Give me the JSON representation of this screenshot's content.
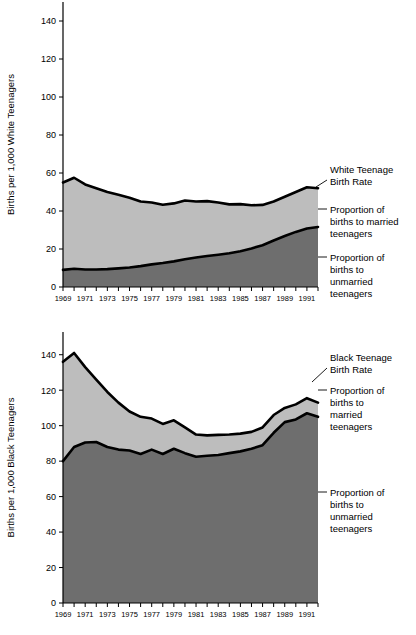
{
  "chart_data": [
    {
      "type": "area",
      "id": "white-teen-births",
      "title": "",
      "xlabel": "",
      "ylabel": "Births per 1,000 White Teenagers",
      "ylim": [
        0,
        150
      ],
      "yticks": [
        0,
        20,
        40,
        60,
        80,
        100,
        120,
        140
      ],
      "xlim": [
        1969,
        1992
      ],
      "x": [
        1969,
        1970,
        1971,
        1972,
        1973,
        1974,
        1975,
        1976,
        1977,
        1978,
        1979,
        1980,
        1981,
        1982,
        1983,
        1984,
        1985,
        1986,
        1987,
        1988,
        1989,
        1990,
        1991,
        1992
      ],
      "xticks": [
        1969,
        1970,
        1971,
        1972,
        1973,
        1974,
        1975,
        1976,
        1977,
        1978,
        1979,
        1980,
        1981,
        1982,
        1983,
        1984,
        1985,
        1986,
        1987,
        1988,
        1989,
        1990,
        1991,
        1992
      ],
      "xtick_labels": [
        "1969",
        "",
        "1971",
        "",
        "1973",
        "",
        "1975",
        "",
        "1977",
        "",
        "1979",
        "",
        "1981",
        "",
        "1983",
        "",
        "1985",
        "",
        "1987",
        "",
        "1989",
        "",
        "1991",
        ""
      ],
      "grid": false,
      "legend_position": "right-annotations",
      "series": [
        {
          "name": "White Teenage Birth Rate",
          "values": [
            55.0,
            57.5,
            54.0,
            52.0,
            50.0,
            48.5,
            47.0,
            45.0,
            44.5,
            43.3,
            44.0,
            45.5,
            45.0,
            45.2,
            44.5,
            43.5,
            43.6,
            43.0,
            43.2,
            45.0,
            47.5,
            50.0,
            52.5,
            52.0
          ]
        },
        {
          "name": "Proportion of births to unmarried teenagers",
          "values": [
            9.0,
            9.6,
            9.2,
            9.2,
            9.4,
            9.8,
            10.3,
            11.0,
            11.9,
            12.6,
            13.5,
            14.6,
            15.5,
            16.3,
            17.0,
            17.8,
            18.8,
            20.3,
            22.0,
            24.5,
            26.8,
            29.0,
            30.8,
            31.6
          ]
        }
      ],
      "bands": [
        {
          "name": "Proportion of births to married teenagers",
          "between": [
            "Proportion of births to unmarried teenagers",
            "White Teenage Birth Rate"
          ],
          "color": "#bdbdbd"
        },
        {
          "name": "Proportion of births to unmarried teenagers",
          "between": [
            "baseline",
            "Proportion of births to unmarried teenagers"
          ],
          "color": "#6e6e6e"
        }
      ],
      "annotations": [
        {
          "text": "White Teenage Birth Rate",
          "lines": [
            "White Teenage",
            "Birth Rate"
          ],
          "target_series": "White Teenage Birth Rate"
        },
        {
          "text": "Proportion of births to married teenagers",
          "lines": [
            "Proportion of",
            "births to married",
            "teenagers"
          ],
          "target_band": "Proportion of births to married teenagers"
        },
        {
          "text": "Proportion of births to unmarried teenagers",
          "lines": [
            "Proportion of",
            "births to",
            "unmarried",
            "teenagers"
          ],
          "target_band": "Proportion of births to unmarried teenagers"
        }
      ]
    },
    {
      "type": "area",
      "id": "black-teen-births",
      "title": "",
      "xlabel": "",
      "ylabel": "Births per 1,000 Black Teenagers",
      "ylim": [
        0,
        150
      ],
      "yticks": [
        0,
        20,
        40,
        60,
        80,
        100,
        120,
        140
      ],
      "xlim": [
        1969,
        1992
      ],
      "x": [
        1969,
        1970,
        1971,
        1972,
        1973,
        1974,
        1975,
        1976,
        1977,
        1978,
        1979,
        1980,
        1981,
        1982,
        1983,
        1984,
        1985,
        1986,
        1987,
        1988,
        1989,
        1990,
        1991,
        1992
      ],
      "xticks": [
        1969,
        1970,
        1971,
        1972,
        1973,
        1974,
        1975,
        1976,
        1977,
        1978,
        1979,
        1980,
        1981,
        1982,
        1983,
        1984,
        1985,
        1986,
        1987,
        1988,
        1989,
        1990,
        1991,
        1992
      ],
      "xtick_labels": [
        "1969",
        "",
        "1971",
        "",
        "1973",
        "",
        "1975",
        "",
        "1977",
        "",
        "1979",
        "",
        "1981",
        "",
        "1983",
        "",
        "1985",
        "",
        "1987",
        "",
        "1989",
        "",
        "1991",
        ""
      ],
      "grid": false,
      "legend_position": "right-annotations",
      "series": [
        {
          "name": "Black Teenage Birth Rate",
          "values": [
            136.0,
            141.0,
            133.0,
            126.0,
            119.0,
            113.0,
            108.0,
            105.0,
            104.0,
            101.0,
            103.0,
            99.0,
            95.0,
            94.5,
            94.8,
            95.0,
            95.5,
            96.5,
            99.0,
            106.0,
            110.0,
            112.0,
            115.5,
            113.0
          ]
        },
        {
          "name": "Proportion of births to unmarried teenagers",
          "values": [
            80.0,
            88.0,
            90.5,
            90.8,
            88.0,
            86.5,
            86.0,
            84.0,
            86.5,
            84.0,
            87.0,
            84.5,
            82.5,
            83.0,
            83.5,
            84.5,
            85.5,
            87.0,
            89.0,
            96.0,
            102.0,
            103.5,
            107.0,
            105.0
          ]
        }
      ],
      "bands": [
        {
          "name": "Proportion of births to married teenagers",
          "between": [
            "Proportion of births to unmarried teenagers",
            "Black Teenage Birth Rate"
          ],
          "color": "#bdbdbd"
        },
        {
          "name": "Proportion of births to unmarried teenagers",
          "between": [
            "baseline",
            "Proportion of births to unmarried teenagers"
          ],
          "color": "#6e6e6e"
        }
      ],
      "annotations": [
        {
          "text": "Black Teenage Birth Rate",
          "lines": [
            "Black Teenage",
            "Birth Rate"
          ],
          "target_series": "Black Teenage Birth Rate"
        },
        {
          "text": "Proportion of births to married teenagers",
          "lines": [
            "Proportion of",
            "births to",
            "married",
            "teenagers"
          ],
          "target_band": "Proportion of births to married teenagers"
        },
        {
          "text": "Proportion of births to unmarried teenagers",
          "lines": [
            "Proportion of",
            "births to",
            "unmarried",
            "teenagers"
          ],
          "target_band": "Proportion of births to unmarried teenagers"
        }
      ]
    }
  ],
  "top_chart": {
    "ylabel": "Births per 1,000 White Teenagers",
    "annotation_1": {
      "l1": "White Teenage",
      "l2": "Birth Rate"
    },
    "annotation_2": {
      "l1": "Proportion of",
      "l2": "births to married",
      "l3": "teenagers"
    },
    "annotation_3": {
      "l1": "Proportion of",
      "l2": "births to",
      "l3": "unmarried",
      "l4": "teenagers"
    }
  },
  "bottom_chart": {
    "ylabel": "Births per 1,000 Black Teenagers",
    "annotation_1": {
      "l1": "Black Teenage",
      "l2": "Birth Rate"
    },
    "annotation_2": {
      "l1": "Proportion of",
      "l2": "births to",
      "l3": "married",
      "l4": "teenagers"
    },
    "annotation_3": {
      "l1": "Proportion of",
      "l2": "births to",
      "l3": "unmarried",
      "l4": "teenagers"
    }
  },
  "colors": {
    "married_band": "#bdbdbd",
    "unmarried_band": "#6e6e6e",
    "line": "#000000",
    "background": "#ffffff"
  }
}
